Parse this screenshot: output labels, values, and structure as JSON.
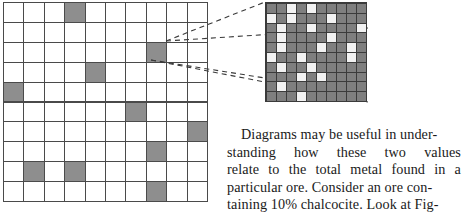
{
  "figure": {
    "coarse_grid": {
      "label": "ore-sample-grid",
      "rows": 10,
      "cols": 10,
      "cell_fill_color": "#8e8e8e",
      "cell_empty_color": "#ffffff",
      "grid_line_color": "#4a4a4a",
      "shaded_cells": [
        [
          1,
          4
        ],
        [
          3,
          8
        ],
        [
          4,
          5
        ],
        [
          5,
          1
        ],
        [
          6,
          7
        ],
        [
          7,
          10
        ],
        [
          8,
          8
        ],
        [
          9,
          2
        ],
        [
          9,
          4
        ],
        [
          10,
          8
        ]
      ]
    },
    "detail_grid": {
      "label": "magnified-cell-grid",
      "rows": 10,
      "cols": 10,
      "cell_fill_color": "#7f7f7f",
      "cell_highlight_color": "#f2f2f2",
      "grid_line_color": "#3b3b3b",
      "white_cells": [
        [
          1,
          3
        ],
        [
          1,
          5
        ],
        [
          2,
          1
        ],
        [
          2,
          3
        ],
        [
          2,
          7
        ],
        [
          3,
          2
        ],
        [
          3,
          5
        ],
        [
          3,
          10
        ],
        [
          4,
          2
        ],
        [
          4,
          7
        ],
        [
          5,
          2
        ],
        [
          5,
          6
        ],
        [
          5,
          9
        ],
        [
          6,
          1
        ],
        [
          6,
          4
        ],
        [
          6,
          9
        ],
        [
          7,
          2
        ],
        [
          7,
          5
        ],
        [
          8,
          4
        ],
        [
          8,
          6
        ],
        [
          9,
          2
        ],
        [
          10,
          4
        ]
      ]
    },
    "leader_lines": {
      "label": "magnifier-leader-lines",
      "style": "dashed",
      "color": "#3a3a3a",
      "source_cell": [
        3,
        8
      ],
      "count": 4
    }
  },
  "text": {
    "paragraph": "Diagrams may be useful in understanding how these two values relate to the total metal found in a particular ore. Consider an ore containing 10% chalcocite. Look at Fig-",
    "lines": [
      {
        "words": [
          "Diagrams",
          "may",
          "be",
          "useful",
          "in",
          "under-"
        ],
        "justified": false,
        "indent": true
      },
      {
        "words": [
          "standing",
          "how",
          "these",
          "two",
          "values"
        ],
        "justified": true,
        "indent": false
      },
      {
        "words": [
          "relate",
          "to",
          "the",
          "total",
          "metal",
          "found",
          "in",
          "a"
        ],
        "justified": true,
        "indent": false
      },
      {
        "words": [
          "particular",
          "ore.",
          "Consider",
          "an",
          "ore",
          "con-"
        ],
        "justified": false,
        "indent": false
      },
      {
        "words": [
          "taining",
          "10%",
          "chalcocite.",
          "Look",
          "at",
          "Fig-"
        ],
        "justified": false,
        "indent": false
      }
    ]
  }
}
